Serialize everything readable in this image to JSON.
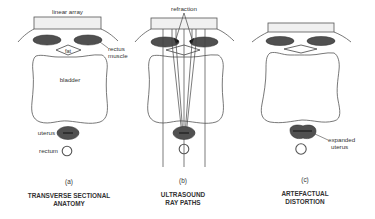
{
  "panels": [
    {
      "id": "a",
      "letter": "(a)",
      "caption_line1": "TRANSVERSE SECTIONAL",
      "caption_line2": "ANATOMY",
      "labels": {
        "array": "linear array",
        "muscle_line1": "rectus",
        "muscle_line2": "muscle",
        "fat": "fat",
        "bladder": "bladder",
        "uterus": "uterus",
        "rectum": "rectum"
      }
    },
    {
      "id": "b",
      "letter": "(b)",
      "caption_line1": "ULTRASOUND",
      "caption_line2": "RAY PATHS",
      "labels": {
        "refraction": "refraction"
      }
    },
    {
      "id": "c",
      "letter": "(c)",
      "caption_line1": "ARTEFACTUAL",
      "caption_line2": "DISTORTION",
      "labels": {
        "uterus_line1": "expanded",
        "uterus_line2": "uterus"
      }
    }
  ],
  "colors": {
    "muscle_fill": "#505050",
    "array_fill": "#f0f0f0",
    "line": "#555555"
  }
}
